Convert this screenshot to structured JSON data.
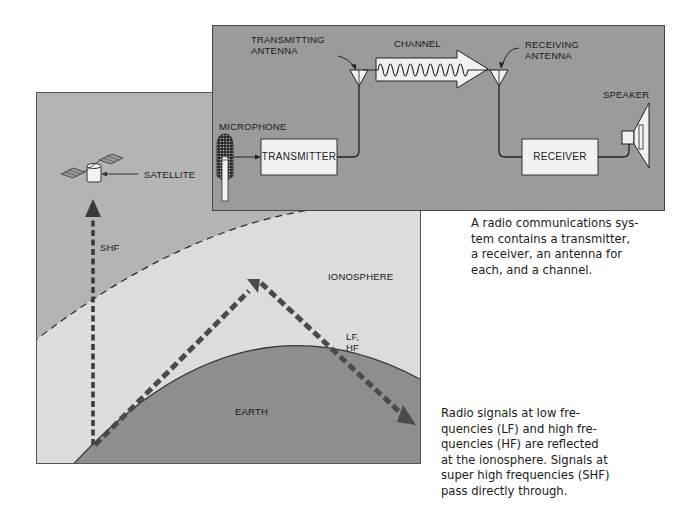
{
  "system_diagram": {
    "labels": {
      "transmitting_antenna": "TRANSMITTING\nANTENNA",
      "channel": "CHANNEL",
      "receiving_antenna": "RECEIVING\nANTENNA",
      "microphone": "MICROPHONE",
      "transmitter": "TRANSMITTER",
      "receiver": "RECEIVER",
      "speaker": "SPEAKER"
    },
    "caption": "A radio communications sys-\ntem contains a transmitter,\na receiver, an antenna for\neach, and a channel."
  },
  "propagation_diagram": {
    "labels": {
      "satellite": "SATELLITE",
      "shf": "SHF",
      "ionosphere": "IONOSPHERE",
      "lf_hf": "LF,\nHF",
      "earth": "EARTH"
    },
    "caption": "Radio signals at low fre-\nquencies (LF) and high fre-\nquencies (HF) are reflected\nat the ionosphere. Signals at\nsuper high frequencies (SHF)\npass directly through."
  },
  "colors": {
    "system_panel_bg": "#9b9b9b",
    "sky": "#b4b4b4",
    "atmosphere_band": "#dcdcdc",
    "earth": "#8e8e8e",
    "box_fill": "#f1f1f1",
    "arrow": "#3a3a3a"
  }
}
